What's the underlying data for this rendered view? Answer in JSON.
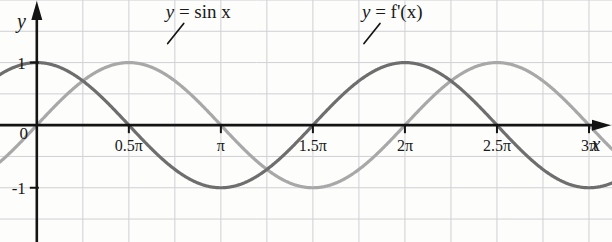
{
  "chart_data": {
    "type": "line",
    "title": "",
    "xlabel": "x",
    "ylabel": "y",
    "xlim": [
      -0.6283185307,
      9.8174770425
    ],
    "ylim": [
      -1.8666666667,
      2.0
    ],
    "grid": true,
    "grid_spacing_x_units": 0.7853981634,
    "grid_spacing_y_units": 0.5,
    "legend": "inline-annotations",
    "xticks": [
      -1.5707963268,
      0,
      1.5707963268,
      3.1415926536,
      4.7123889804,
      6.2831853072,
      7.853981634,
      9.4247779608
    ],
    "xticklabels": [
      "-0.5π",
      "0",
      "0.5π",
      "π",
      "1.5π",
      "2π",
      "2.5π",
      "3π"
    ],
    "yticks": [
      1,
      -1
    ],
    "yticklabels": [
      "1",
      "-1"
    ],
    "series": [
      {
        "name": "y = sin x",
        "function": "sin(x)",
        "color": "#a8a8a8",
        "linewidth": 3.2,
        "annotation": "y = sin x",
        "annotation_x": 2.2,
        "annotation_y": 1.72,
        "key_points": [
          {
            "x": -1.5707963268,
            "y": -1
          },
          {
            "x": 0,
            "y": 0
          },
          {
            "x": 1.5707963268,
            "y": 1
          },
          {
            "x": 3.1415926536,
            "y": 0
          },
          {
            "x": 4.7123889804,
            "y": -1
          },
          {
            "x": 6.2831853072,
            "y": 0
          },
          {
            "x": 7.853981634,
            "y": 1
          },
          {
            "x": 9.4247779608,
            "y": 0
          }
        ]
      },
      {
        "name": "y = f'(x)",
        "function": "cos(x)",
        "color": "#6e6e6e",
        "linewidth": 3.2,
        "annotation": "y = f'(x)",
        "annotation_x": 5.55,
        "annotation_y": 1.72,
        "key_points": [
          {
            "x": -1.5707963268,
            "y": 0
          },
          {
            "x": 0,
            "y": 1
          },
          {
            "x": 1.5707963268,
            "y": 0
          },
          {
            "x": 3.1415926536,
            "y": -1
          },
          {
            "x": 4.7123889804,
            "y": 0
          },
          {
            "x": 6.2831853072,
            "y": 1
          },
          {
            "x": 7.853981634,
            "y": 0
          },
          {
            "x": 9.4247779608,
            "y": -1
          }
        ]
      }
    ]
  },
  "axes": {
    "x_axis_label": "x",
    "y_axis_label": "y",
    "origin_label": "0",
    "y_pos_one_label": "1",
    "y_neg_one_label": "-1"
  },
  "annotations": {
    "sin_label": "y = sin x",
    "fprime_label": "y = f'(x)"
  },
  "colors": {
    "background": "#fdfdfb",
    "grid": "#c9c9cf",
    "axis": "#141414",
    "sin_curve": "#a8a8a8",
    "fprime_curve": "#6e6e6e",
    "text": "#1a1a1a"
  }
}
